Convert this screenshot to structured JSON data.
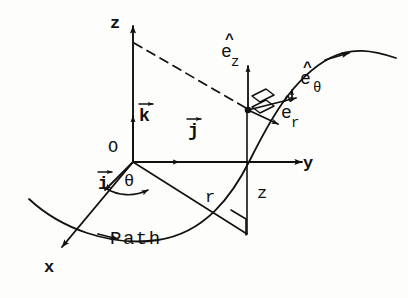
{
  "figure": {
    "background_color": "#fdfdfb",
    "ink_color": "#111111"
  },
  "axes": {
    "z": {
      "label": "z",
      "description": "vertical axis pointing up"
    },
    "y": {
      "label": "y",
      "description": "horizontal axis pointing right"
    },
    "x": {
      "label": "x",
      "description": "oblique axis pointing down-left toward viewer"
    },
    "origin": {
      "label": "O"
    }
  },
  "cartesian_basis": [
    {
      "name": "i-hat",
      "label": "i",
      "accent": "vector-arrow",
      "along": "x"
    },
    {
      "name": "j-hat",
      "label": "j",
      "accent": "vector-arrow",
      "along": "y"
    },
    {
      "name": "k-hat",
      "label": "k",
      "accent": "vector-arrow",
      "along": "z"
    }
  ],
  "cylindrical_basis": [
    {
      "name": "e-r",
      "label": "e",
      "subscript": "r",
      "accent": "hat",
      "description": "radial unit vector"
    },
    {
      "name": "e-theta",
      "label": "e",
      "subscript": "θ",
      "accent": "hat",
      "description": "azimuthal unit vector"
    },
    {
      "name": "e-z",
      "label": "e",
      "subscript": "z",
      "accent": "hat",
      "description": "axial unit vector"
    }
  ],
  "scalars": [
    {
      "name": "radius",
      "label": "r",
      "description": "radial distance in the xy-plane"
    },
    {
      "name": "height",
      "label": "z",
      "description": "height above the xy-plane"
    },
    {
      "name": "azimuth",
      "label": "θ",
      "description": "angle measured from the x-axis"
    }
  ],
  "annotations": {
    "path_label": "Path",
    "right_angle_markers": 3,
    "dashed_projection": "dashed line from z-axis to particle"
  }
}
